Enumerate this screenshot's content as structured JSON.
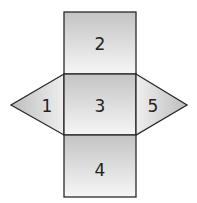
{
  "diagram": {
    "type": "net of triangular-faced solid",
    "faces": [
      {
        "id": "1",
        "shape": "triangle",
        "position": "left"
      },
      {
        "id": "2",
        "shape": "square",
        "position": "top"
      },
      {
        "id": "3",
        "shape": "square",
        "position": "center"
      },
      {
        "id": "4",
        "shape": "square",
        "position": "bottom"
      },
      {
        "id": "5",
        "shape": "triangle",
        "position": "right"
      }
    ],
    "labels": {
      "f1": "1",
      "f2": "2",
      "f3": "3",
      "f4": "4",
      "f5": "5"
    },
    "colors": {
      "stroke": "#2a2a2a",
      "fill_dark": "#c4c4c4",
      "fill_light": "#f4f4f4"
    }
  }
}
